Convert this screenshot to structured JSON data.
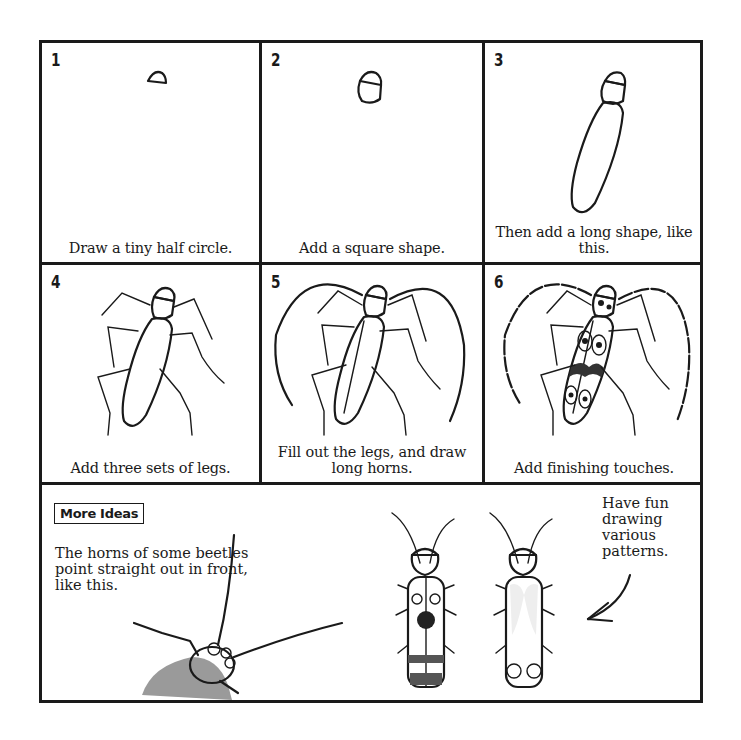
{
  "steps": [
    {
      "number": "1",
      "caption": "Draw a tiny half circle."
    },
    {
      "number": "2",
      "caption": "Add a square shape."
    },
    {
      "number": "3",
      "caption": "Then add a long shape, like this."
    },
    {
      "number": "4",
      "caption": "Add three sets of legs."
    },
    {
      "number": "5",
      "caption": "Fill out the legs, and draw long horns."
    },
    {
      "number": "6",
      "caption": "Add finishing touches."
    }
  ],
  "more_ideas": {
    "badge": "More Ideas",
    "text": "The horns of some beetles point straight out in front, like this.",
    "patterns_text": "Have fun drawing various patterns."
  },
  "colors": {
    "ink": "#1a1a1a",
    "paper": "#ffffff",
    "shade": "#9a9a9a"
  }
}
